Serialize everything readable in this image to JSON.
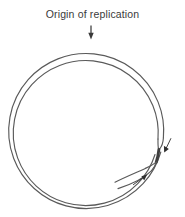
{
  "figure": {
    "name": "origin-of-replication-diagram",
    "title": "Origin of replication",
    "background_color": "#ffffff",
    "line_color": "#5a5a5a",
    "dark_line_color": "#3a3a3a",
    "text_color": "#3a3a3a"
  },
  "annotations": {
    "origin_label": "Origin of replication",
    "origin_pointer": {
      "icon": "down-arrow-icon",
      "points_to": "top of circular DNA molecule",
      "direction": "down"
    },
    "fork_arrow_upper": {
      "icon": "arrow-icon",
      "direction": "down-right",
      "meaning": "replication fork movement"
    },
    "fork_arrow_lower": {
      "icon": "arrow-icon",
      "direction": "up-right",
      "meaning": "replication fork movement"
    }
  },
  "structure": {
    "shape": "circular double-stranded DNA",
    "strands": 2,
    "fork_region": "lower right",
    "circle": {
      "center_x": 88.5,
      "center_y": 121,
      "outer_radius": 77.5,
      "inner_radius": 72.5
    }
  }
}
